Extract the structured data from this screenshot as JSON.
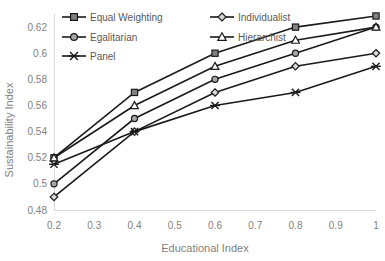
{
  "chart_data": {
    "type": "line",
    "title": "",
    "xlabel": "Educational Index",
    "ylabel": "Sustainability Index",
    "x": [
      0.2,
      0.4,
      0.6,
      0.8,
      1.0
    ],
    "xtick_labels": [
      "0.2",
      "0.3",
      "0.4",
      "0.5",
      "0.6",
      "0.7",
      "0.8",
      "0.9",
      "1"
    ],
    "xticks": [
      0.2,
      0.3,
      0.4,
      0.5,
      0.6,
      0.7,
      0.8,
      0.9,
      1.0
    ],
    "ytick_labels": [
      "0.48",
      "0.5",
      "0.52",
      "0.54",
      "0.56",
      "0.58",
      "0.6",
      "0.62"
    ],
    "yticks": [
      0.48,
      0.5,
      0.52,
      0.54,
      0.56,
      0.58,
      0.6,
      0.62
    ],
    "xlim": [
      0.2,
      1.0
    ],
    "ylim": [
      0.48,
      0.6285
    ],
    "grid": false,
    "legend_position": "top-left",
    "series": [
      {
        "name": "Equal Weighting",
        "marker": "square",
        "values": [
          0.52,
          0.57,
          0.6,
          0.62,
          0.6285
        ]
      },
      {
        "name": "Individualist",
        "marker": "diamond",
        "values": [
          0.49,
          0.54,
          0.57,
          0.59,
          0.6
        ]
      },
      {
        "name": "Egalitarian",
        "marker": "circle",
        "values": [
          0.5,
          0.55,
          0.58,
          0.6,
          0.62
        ]
      },
      {
        "name": "Hierarchist",
        "marker": "triangle",
        "values": [
          0.52,
          0.56,
          0.59,
          0.61,
          0.62
        ]
      },
      {
        "name": "Panel",
        "marker": "x",
        "values": [
          0.515,
          0.54,
          0.56,
          0.57,
          0.59
        ]
      }
    ],
    "legend_layout": [
      {
        "name": "Equal Weighting",
        "marker": "square",
        "col": 0,
        "row": 0
      },
      {
        "name": "Individualist",
        "marker": "diamond",
        "col": 1,
        "row": 0
      },
      {
        "name": "Egalitarian",
        "marker": "circle",
        "col": 0,
        "row": 1
      },
      {
        "name": "Hierarchist",
        "marker": "triangle",
        "col": 1,
        "row": 1
      },
      {
        "name": "Panel",
        "marker": "x",
        "col": 0,
        "row": 2
      }
    ],
    "colors": {
      "line": "#1a1a1a",
      "axis": "#d9d9d9",
      "tick_text": "#7f7f7f",
      "legend_text": "#595959",
      "background": "#ffffff"
    }
  }
}
